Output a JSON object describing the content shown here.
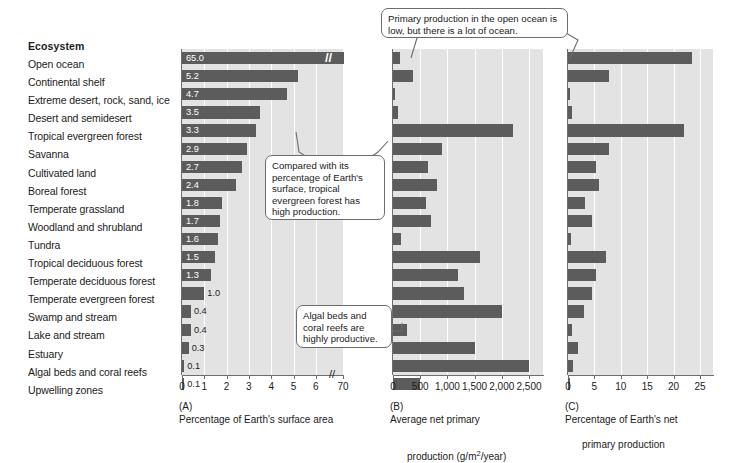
{
  "header": {
    "column_title": "Ecosystem"
  },
  "ecosystems": [
    "Open ocean",
    "Continental shelf",
    "Extreme desert, rock, sand, ice",
    "Desert and semidesert",
    "Tropical evergreen forest",
    "Savanna",
    "Cultivated land",
    "Boreal forest",
    "Temperate grassland",
    "Woodland and shrubland",
    "Tundra",
    "Tropical deciduous forest",
    "Temperate deciduous forest",
    "Temperate evergreen forest",
    "Swamp and stream",
    "Lake and stream",
    "Estuary",
    "Algal beds and coral reefs",
    "Upwelling zones"
  ],
  "captions": {
    "a_tag": "(A)",
    "a_text": "Percentage of Earth's surface area",
    "b_tag": "(B)",
    "b_line1": "Average net primary",
    "b_line2_pre": "production (g/m",
    "b_line2_sup": "2",
    "b_line2_post": "/year)",
    "c_tag": "(C)",
    "c_line1": "Percentage of Earth's net",
    "c_line2": "primary production"
  },
  "callouts": [
    {
      "id": "open-ocean",
      "text": "Primary production in the open ocean is low, but there is a lot of ocean."
    },
    {
      "id": "tropical-evergreen",
      "text": "Compared with its percentage of Earth's surface, tropical evergreen forest has high production."
    },
    {
      "id": "algal-beds",
      "text": "Algal beds and coral reefs are highly productive."
    }
  ],
  "colors": {
    "bar": "#5c5c5c",
    "plot_background": "#e3e3e3",
    "gridline": "#ffffff",
    "axis": "#6d6d6d",
    "bar_label": "#ffffff"
  },
  "chart_data": [
    {
      "id": "A",
      "type": "bar",
      "orientation": "horizontal",
      "title": "(A) Percentage of Earth's surface area",
      "xlabel": "Percentage of Earth's surface area",
      "ylabel": "Ecosystem",
      "xlim": [
        0,
        7
      ],
      "ticks": [
        "0",
        "1",
        "2",
        "3",
        "4",
        "5",
        "6",
        "70"
      ],
      "axis_break": true,
      "axis_break_after_tick": "6",
      "grid": true,
      "data_labels": true,
      "categories": [
        "Open ocean",
        "Continental shelf",
        "Extreme desert, rock, sand, ice",
        "Desert and semidesert",
        "Tropical evergreen forest",
        "Savanna",
        "Cultivated land",
        "Boreal forest",
        "Temperate grassland",
        "Woodland and shrubland",
        "Tundra",
        "Tropical deciduous forest",
        "Temperate deciduous forest",
        "Temperate evergreen forest",
        "Swamp and stream",
        "Lake and stream",
        "Estuary",
        "Algal beds and coral reefs",
        "Upwelling zones"
      ],
      "values": [
        65.0,
        5.2,
        4.7,
        3.5,
        3.3,
        2.9,
        2.7,
        2.4,
        1.8,
        1.7,
        1.6,
        1.5,
        1.3,
        1.0,
        0.4,
        0.4,
        0.3,
        0.1,
        0.1
      ],
      "labels": [
        "65.0",
        "5.2",
        "4.7",
        "3.5",
        "3.3",
        "2.9",
        "2.7",
        "2.4",
        "1.8",
        "1.7",
        "1.6",
        "1.5",
        "1.3",
        "1.0",
        "0.4",
        "0.4",
        "0.3",
        "0.1",
        "0.1"
      ]
    },
    {
      "id": "B",
      "type": "bar",
      "orientation": "horizontal",
      "title": "(B) Average net primary production (g/m2/year)",
      "xlabel": "Average net primary production (g/m2/year)",
      "ylabel": "Ecosystem",
      "xlim": [
        0,
        2700
      ],
      "ticks": [
        "0",
        "500",
        "1,000",
        "1,500",
        "2,000",
        "2,500"
      ],
      "grid": true,
      "data_labels": false,
      "categories": [
        "Open ocean",
        "Continental shelf",
        "Extreme desert, rock, sand, ice",
        "Desert and semidesert",
        "Tropical evergreen forest",
        "Savanna",
        "Cultivated land",
        "Boreal forest",
        "Temperate grassland",
        "Woodland and shrubland",
        "Tundra",
        "Tropical deciduous forest",
        "Temperate deciduous forest",
        "Temperate evergreen forest",
        "Swamp and stream",
        "Lake and stream",
        "Estuary",
        "Algal beds and coral reefs",
        "Upwelling zones"
      ],
      "values": [
        125,
        360,
        3,
        90,
        2200,
        900,
        650,
        800,
        600,
        700,
        140,
        1600,
        1200,
        1300,
        2000,
        250,
        1500,
        2500,
        500
      ]
    },
    {
      "id": "C",
      "type": "bar",
      "orientation": "horizontal",
      "title": "(C) Percentage of Earth's net primary production",
      "xlabel": "Percentage of Earth's net primary production",
      "ylabel": "Ecosystem",
      "xlim": [
        0,
        26
      ],
      "ticks": [
        "0",
        "5",
        "10",
        "15",
        "20",
        "25"
      ],
      "grid": true,
      "data_labels": false,
      "categories": [
        "Open ocean",
        "Continental shelf",
        "Extreme desert, rock, sand, ice",
        "Desert and semidesert",
        "Tropical evergreen forest",
        "Savanna",
        "Cultivated land",
        "Boreal forest",
        "Temperate grassland",
        "Woodland and shrubland",
        "Tundra",
        "Tropical deciduous forest",
        "Temperate deciduous forest",
        "Temperate evergreen forest",
        "Swamp and stream",
        "Lake and stream",
        "Estuary",
        "Algal beds and coral reefs",
        "Upwelling zones"
      ],
      "values": [
        23.5,
        7.8,
        0.4,
        0.8,
        22.0,
        7.8,
        5.3,
        5.9,
        3.3,
        4.5,
        0.6,
        7.2,
        5.3,
        4.5,
        3.0,
        0.7,
        1.8,
        1.0,
        0.4
      ]
    }
  ]
}
